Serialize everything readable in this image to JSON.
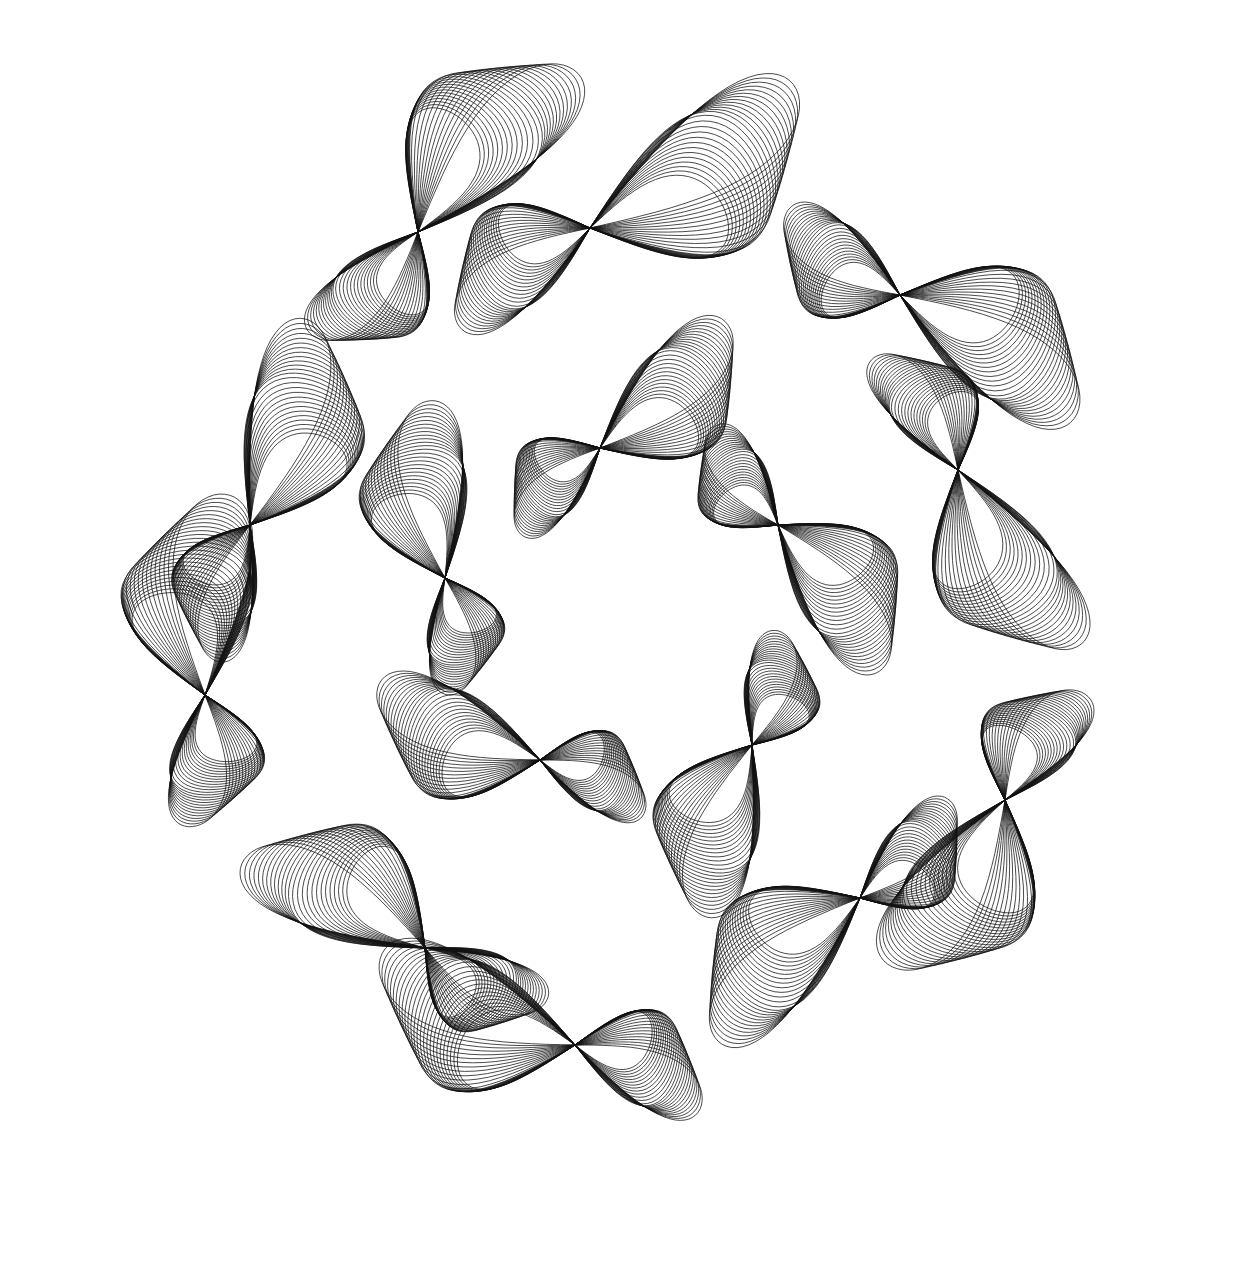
{
  "artwork": {
    "background": "#ffffff",
    "stroke_color": "#111111",
    "stroke_width": 0.9,
    "center": [
      620,
      640
    ],
    "families": 7,
    "curves_per_family": 26,
    "description": "Harmonograph-style line drawing: 7 rotationally arranged families of thin looping curves, each pinching at a knot"
  },
  "lobes": [
    {
      "knot": [
        418,
        232
      ],
      "rot": -60,
      "reach": 190,
      "spread": 120,
      "twist": 1.0
    },
    {
      "knot": [
        590,
        228
      ],
      "rot": -20,
      "reach": 210,
      "spread": 130,
      "twist": -1.0
    },
    {
      "knot": [
        900,
        295
      ],
      "rot": 20,
      "reach": 180,
      "spread": 120,
      "twist": 1.0
    },
    {
      "knot": [
        958,
        470
      ],
      "rot": 70,
      "reach": 180,
      "spread": 110,
      "twist": -1.0
    },
    {
      "knot": [
        1005,
        800
      ],
      "rot": 110,
      "reach": 170,
      "spread": 120,
      "twist": 1.0
    },
    {
      "knot": [
        860,
        898
      ],
      "rot": 150,
      "reach": 170,
      "spread": 110,
      "twist": -1.0
    },
    {
      "knot": [
        575,
        1045
      ],
      "rot": 190,
      "reach": 180,
      "spread": 120,
      "twist": 1.0
    },
    {
      "knot": [
        425,
        948
      ],
      "rot": 220,
      "reach": 170,
      "spread": 110,
      "twist": -1.0
    },
    {
      "knot": [
        205,
        695
      ],
      "rot": 260,
      "reach": 170,
      "spread": 120,
      "twist": 1.0
    },
    {
      "knot": [
        250,
        525
      ],
      "rot": 300,
      "reach": 180,
      "spread": 110,
      "twist": -1.0
    },
    {
      "knot": [
        445,
        578
      ],
      "rot": 250,
      "reach": 150,
      "spread": 100,
      "twist": 1.0
    },
    {
      "knot": [
        600,
        448
      ],
      "rot": 330,
      "reach": 150,
      "spread": 100,
      "twist": -1.0
    },
    {
      "knot": [
        778,
        525
      ],
      "rot": 40,
      "reach": 150,
      "spread": 100,
      "twist": 1.0
    },
    {
      "knot": [
        752,
        745
      ],
      "rot": 120,
      "reach": 150,
      "spread": 100,
      "twist": -1.0
    },
    {
      "knot": [
        540,
        760
      ],
      "rot": 190,
      "reach": 150,
      "spread": 100,
      "twist": 1.0
    }
  ]
}
